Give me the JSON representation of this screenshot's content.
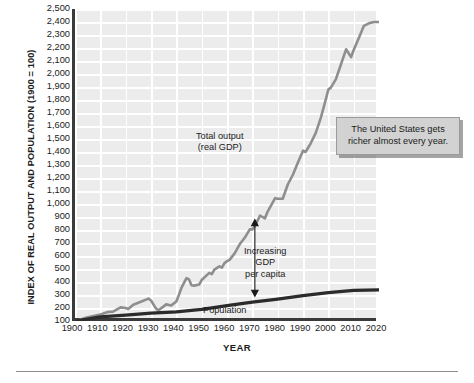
{
  "axes": {
    "y_title": "INDEX OF REAL OUTPUT AND POPULATION (1900 = 100)",
    "x_title": "YEAR",
    "y_ticks": [
      "2,500",
      "2,400",
      "2,300",
      "2,200",
      "2,100",
      "2,000",
      "1,900",
      "1,800",
      "1,700",
      "1,600",
      "1,500",
      "1,400",
      "1,300",
      "1,200",
      "1,100",
      "1,000",
      "900",
      "800",
      "700",
      "600",
      "500",
      "400",
      "300",
      "200",
      "100"
    ],
    "x_ticks": [
      "1900",
      "1910",
      "1920",
      "1930",
      "1940",
      "1950",
      "1960",
      "1970",
      "1980",
      "1990",
      "2000",
      "2010",
      "2020"
    ]
  },
  "annotations": {
    "gdp_line1": "Total output",
    "gdp_line2": "(real GDP)",
    "percap_line1": "Increasing",
    "percap_line2": "GDP",
    "percap_line3": "per capita",
    "population": "Population",
    "callout_line1": "The United States gets",
    "callout_line2": "richer almost every year."
  },
  "colors": {
    "plot_background": "#ececec",
    "gridline": "#ffffff",
    "axis": "#3a3a3a",
    "gdp_line": "#8e8e8e",
    "population_line": "#2b2b2b",
    "callout_fill": "#d2d2d2",
    "text": "#1b1b1b"
  },
  "chart_data": {
    "type": "line",
    "title": "",
    "xlabel": "YEAR",
    "ylabel": "INDEX OF REAL OUTPUT AND POPULATION (1900 = 100)",
    "xlim": [
      1900,
      2020
    ],
    "ylim": [
      100,
      2500
    ],
    "ytick_step": 100,
    "xtick_step": 10,
    "grid": true,
    "legend": "none (in-plot labels)",
    "annotations": [
      {
        "text": "Total output (real GDP)",
        "x": 1962,
        "y": 1450,
        "target": "gdp-series"
      },
      {
        "text": "Increasing GDP per capita",
        "x": 1978,
        "y": 640,
        "target": "gap-arrow"
      },
      {
        "text": "Population",
        "x": 1968,
        "y": 150,
        "target": "population-series"
      },
      {
        "text": "The United States gets richer almost every year.",
        "x": 2018,
        "y": 1560,
        "type": "callout"
      }
    ],
    "arrow": {
      "type": "double-headed-vertical",
      "x": 1971,
      "y_bottom": 290,
      "y_top": 880
    },
    "series": [
      {
        "name": "Total output (real GDP)",
        "color": "#8e8e8e",
        "x": [
          1900,
          1905,
          1910,
          1913,
          1915,
          1918,
          1920,
          1921,
          1923,
          1925,
          1929,
          1930,
          1932,
          1933,
          1936,
          1938,
          1940,
          1941,
          1942,
          1944,
          1945,
          1946,
          1947,
          1949,
          1950,
          1953,
          1954,
          1955,
          1957,
          1958,
          1959,
          1960,
          1961,
          1963,
          1965,
          1967,
          1969,
          1970,
          1971,
          1973,
          1975,
          1976,
          1979,
          1980,
          1982,
          1984,
          1986,
          1988,
          1990,
          1991,
          1993,
          1995,
          1997,
          1999,
          2000,
          2001,
          2003,
          2005,
          2007,
          2009,
          2010,
          2012,
          2014,
          2016,
          2018,
          2020
        ],
        "y": [
          100,
          128,
          150,
          170,
          172,
          205,
          200,
          192,
          225,
          240,
          272,
          258,
          195,
          182,
          228,
          220,
          250,
          300,
          355,
          430,
          420,
          375,
          372,
          380,
          415,
          470,
          460,
          495,
          520,
          510,
          545,
          560,
          570,
          620,
          690,
          740,
          805,
          805,
          830,
          910,
          890,
          940,
          1045,
          1040,
          1040,
          1150,
          1225,
          1320,
          1410,
          1400,
          1465,
          1545,
          1660,
          1805,
          1880,
          1895,
          1960,
          2075,
          2190,
          2130,
          2185,
          2275,
          2370,
          2390,
          2400,
          2400
        ]
      },
      {
        "name": "Population",
        "color": "#2b2b2b",
        "x": [
          1900,
          1910,
          1920,
          1930,
          1940,
          1950,
          1960,
          1970,
          1980,
          1990,
          2000,
          2010,
          2020
        ],
        "y": [
          100,
          132,
          145,
          160,
          170,
          190,
          218,
          245,
          268,
          295,
          318,
          335,
          340
        ]
      }
    ]
  }
}
